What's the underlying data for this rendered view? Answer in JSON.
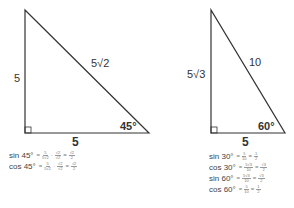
{
  "left_triangle": {
    "leg_vertical": "5",
    "leg_horizontal": "5",
    "hypotenuse": "5√2",
    "angle": "45°",
    "formulas": [
      {
        "name": "sin 45°",
        "terms": [
          {
            "num": "5",
            "den": "5√2"
          },
          {
            "num": "√2",
            "den": "√2"
          }
        ],
        "result": {
          "num": "√2",
          "den": "2"
        }
      },
      {
        "name": "cos 45°",
        "terms": [
          {
            "num": "5",
            "den": "5√2"
          },
          {
            "num": "√2",
            "den": "√2"
          }
        ],
        "result": {
          "num": "√2",
          "den": "2"
        }
      }
    ]
  },
  "right_triangle": {
    "leg_vertical": "5√3",
    "leg_horizontal": "5",
    "hypotenuse": "10",
    "angle": "60°",
    "formulas": [
      {
        "name": "sin 30°",
        "terms": [
          {
            "num": "5",
            "den": "10"
          }
        ],
        "result": {
          "num": "1",
          "den": "2"
        }
      },
      {
        "name": "cos 30°",
        "terms": [
          {
            "num": "5√3",
            "den": "10"
          }
        ],
        "result": {
          "num": "√3",
          "den": "2"
        }
      },
      {
        "name": "sin 60°",
        "terms": [
          {
            "num": "5√3",
            "den": "10"
          }
        ],
        "result": {
          "num": "√3",
          "den": "2"
        }
      },
      {
        "name": "cos 60°",
        "terms": [
          {
            "num": "5",
            "den": "10"
          }
        ],
        "result": {
          "num": "1",
          "den": "2"
        }
      }
    ]
  },
  "colors": {
    "line": "#333333",
    "text": "#333333"
  }
}
